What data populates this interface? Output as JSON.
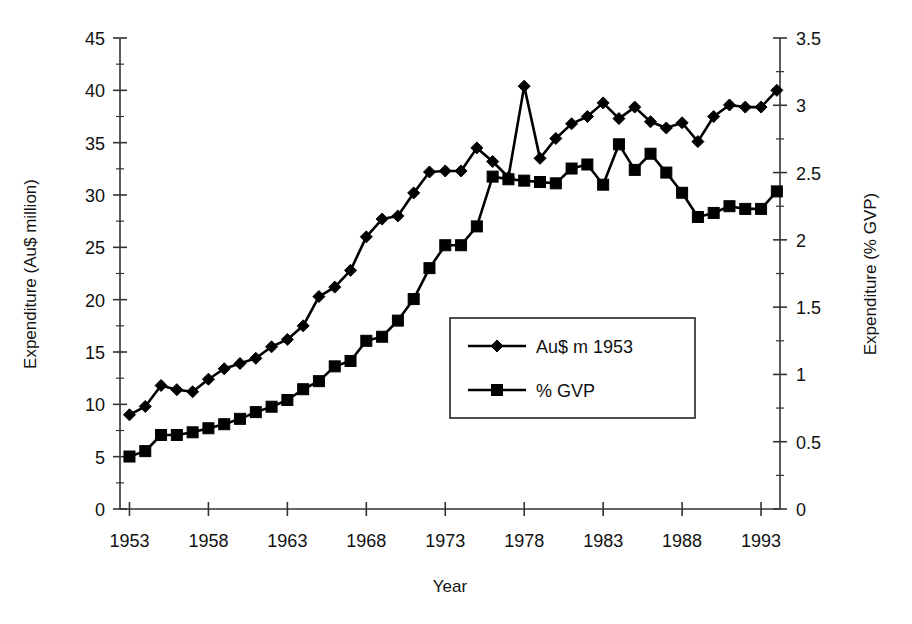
{
  "chart_data": {
    "type": "line",
    "title": "",
    "xlabel": "Year",
    "ylabel": "Expenditure (Au$ million)",
    "y2label": "Expenditure (% GVP)",
    "xlim": [
      1952.4,
      1994.2
    ],
    "ylim": [
      0,
      45
    ],
    "y2lim": [
      0,
      3.5
    ],
    "grid": false,
    "legend_position": "center-right-inside",
    "x_tick_labels": [
      "1953",
      "1958",
      "1963",
      "1968",
      "1973",
      "1978",
      "1983",
      "1988",
      "1993"
    ],
    "x_ticks": [
      1953,
      1958,
      1963,
      1968,
      1973,
      1978,
      1983,
      1988,
      1993
    ],
    "y_tick_labels": [
      "0",
      "5",
      "10",
      "15",
      "20",
      "25",
      "30",
      "35",
      "40",
      "45"
    ],
    "y_ticks": [
      0,
      5,
      10,
      15,
      20,
      25,
      30,
      35,
      40,
      45
    ],
    "y2_tick_labels": [
      "0",
      "0.5",
      "1",
      "1.5",
      "2",
      "2.5",
      "3",
      "3.5"
    ],
    "y2_ticks": [
      0,
      0.5,
      1,
      1.5,
      2,
      2.5,
      3,
      3.5
    ],
    "x": [
      1953,
      1954,
      1955,
      1956,
      1957,
      1958,
      1959,
      1960,
      1961,
      1962,
      1963,
      1964,
      1965,
      1966,
      1967,
      1968,
      1969,
      1970,
      1971,
      1972,
      1973,
      1974,
      1975,
      1976,
      1977,
      1978,
      1979,
      1980,
      1981,
      1982,
      1983,
      1984,
      1985,
      1986,
      1987,
      1988,
      1989,
      1990,
      1991,
      1992,
      1993,
      1994
    ],
    "series": [
      {
        "name": "Au$ m 1953",
        "marker": "diamond",
        "axis": "left",
        "color": "#000000",
        "values": [
          9.0,
          9.8,
          11.8,
          11.4,
          11.2,
          12.4,
          13.4,
          13.9,
          14.4,
          15.5,
          16.2,
          17.5,
          20.3,
          21.2,
          22.8,
          26.0,
          27.7,
          28.0,
          30.2,
          32.2,
          32.3,
          32.3,
          34.5,
          33.2,
          31.7,
          40.4,
          33.5,
          35.4,
          36.8,
          37.5,
          38.8,
          37.3,
          38.4,
          37.0,
          36.4,
          36.9,
          35.1,
          37.5,
          38.6,
          38.4,
          38.4,
          40.0
        ]
      },
      {
        "name": "% GVP",
        "marker": "square",
        "axis": "right",
        "color": "#000000",
        "values": [
          0.39,
          0.43,
          0.55,
          0.55,
          0.57,
          0.6,
          0.63,
          0.67,
          0.72,
          0.76,
          0.81,
          0.89,
          0.95,
          1.06,
          1.1,
          1.25,
          1.28,
          1.4,
          1.56,
          1.79,
          1.96,
          1.96,
          2.1,
          2.47,
          2.45,
          2.44,
          2.43,
          2.42,
          2.53,
          2.56,
          2.41,
          2.71,
          2.52,
          2.64,
          2.5,
          2.35,
          2.17,
          2.2,
          2.25,
          2.23,
          2.23,
          2.36
        ]
      }
    ]
  },
  "legend": {
    "entries": [
      {
        "label": "Au$ m 1953",
        "marker": "diamond-marker"
      },
      {
        "label": "% GVP",
        "marker": "square-marker"
      }
    ]
  },
  "axes": {
    "left_title": "Expenditure (Au$ million)",
    "right_title": "Expenditure (% GVP)",
    "bottom_title": "Year"
  }
}
